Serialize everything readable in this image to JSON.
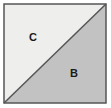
{
  "figure": {
    "type": "divided-square-diagram",
    "canvas": {
      "width": 111,
      "height": 108,
      "background": "#ffffff"
    },
    "square": {
      "x": 4,
      "y": 4,
      "width": 102,
      "height": 99,
      "border_color": "#555555",
      "border_width": 1.5
    },
    "divider": {
      "name": "diagonal-divider",
      "from": "bottom-left",
      "to": "top-right",
      "color": "#555555",
      "width": 1.5
    },
    "regions": [
      {
        "id": "region-c",
        "label": "C",
        "position": "upper-left",
        "fill": "#eeeeec",
        "label_x": 33,
        "label_y": 38
      },
      {
        "id": "region-b",
        "label": "B",
        "position": "lower-right",
        "fill": "#c2c2c2",
        "label_x": 74,
        "label_y": 74
      }
    ]
  }
}
